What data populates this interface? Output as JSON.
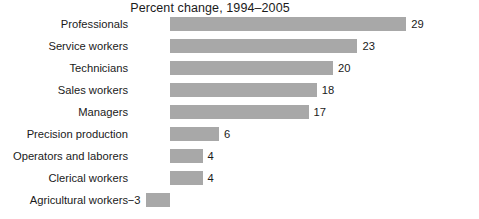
{
  "chart_data": {
    "type": "bar",
    "orientation": "horizontal",
    "title": "Percent change, 1994–2005",
    "xlabel": "",
    "ylabel": "",
    "grid": false,
    "legend": null,
    "xlim": [
      -3,
      29
    ],
    "categories": [
      "Professionals",
      "Service workers",
      "Technicians",
      "Sales workers",
      "Managers",
      "Precision production",
      "Operators and laborers",
      "Clerical workers",
      "Agricultural workers"
    ],
    "values": [
      29,
      23,
      20,
      18,
      17,
      6,
      4,
      4,
      -3
    ],
    "value_labels": [
      "29",
      "23",
      "20",
      "18",
      "17",
      "6",
      "4",
      "4",
      "−3"
    ],
    "bar_color": "#a8a8a8",
    "text_color": "#1a1a1a",
    "background_color": "#ffffff"
  }
}
